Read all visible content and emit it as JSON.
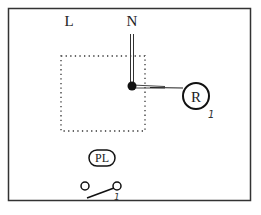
{
  "diagram": {
    "labels": {
      "live": "L",
      "neutral": "N",
      "rose": "R",
      "pilot_light": "PL",
      "rose_mark": "1",
      "switch_mark": "1"
    },
    "colors": {
      "frame": "#333333",
      "ink": "#111111",
      "dots": "#333333",
      "background": "#ffffff"
    }
  }
}
